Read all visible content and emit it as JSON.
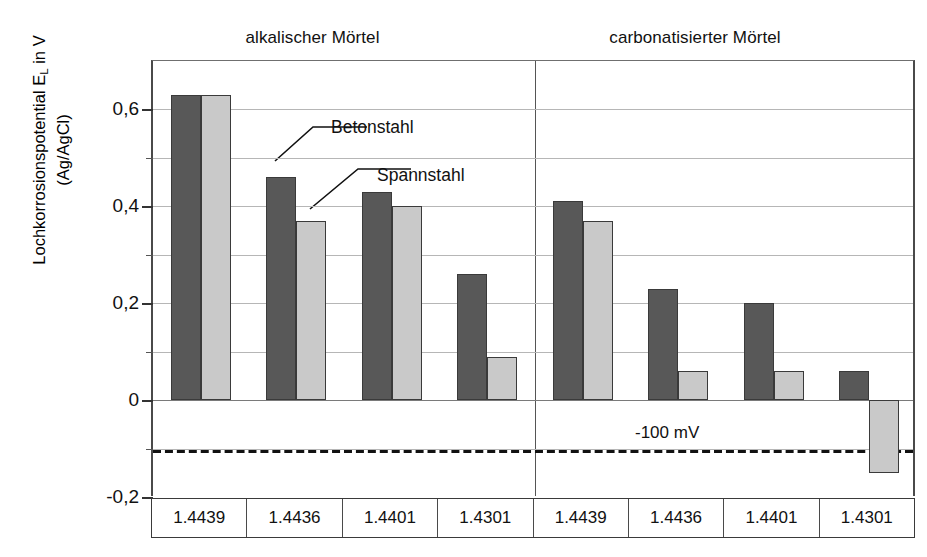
{
  "titles": {
    "left_group": "alkalischer Mörtel",
    "right_group": "carbonatisierter Mörtel"
  },
  "axis": {
    "ylabel_line1": "Lochkorrosionspotential E",
    "ylabel_line1_sub": "L",
    "ylabel_line1_tail": " in V",
    "ylabel_line2": "(Ag/AgCl)",
    "ticks": [
      "0,6",
      "0,4",
      "0,2",
      "0",
      "-0,2"
    ]
  },
  "annotations": {
    "series_dark": "Betonstahl",
    "series_light": "Spannstahl",
    "refline": "-100 mV"
  },
  "colors": {
    "dark_bar": "#585858",
    "light_bar": "#c9c9c9",
    "bar_outline": "#3a3a3a",
    "gridline": "#b6b6b6",
    "axis": "#4a4a4a"
  },
  "categories": [
    "1.4439",
    "1.4436",
    "1.4401",
    "1.4301",
    "1.4439",
    "1.4436",
    "1.4401",
    "1.4301"
  ],
  "chart_data": {
    "type": "bar",
    "title": "",
    "xlabel": "",
    "ylabel": "Lochkorrosionspotential E_L in V (Ag/AgCl)",
    "ylim": [
      -0.2,
      0.7
    ],
    "yticks": [
      -0.2,
      0,
      0.2,
      0.4,
      0.6
    ],
    "minor_gridlines": [
      -0.1,
      0.1,
      0.3,
      0.5
    ],
    "grid": true,
    "legend_position": "inline-callout",
    "group_labels": [
      "alkalischer Mörtel",
      "carbonatisierter Mörtel"
    ],
    "categories": [
      "1.4439",
      "1.4436",
      "1.4401",
      "1.4301",
      "1.4439",
      "1.4436",
      "1.4401",
      "1.4301"
    ],
    "series": [
      {
        "name": "Betonstahl",
        "color": "#585858",
        "values": [
          0.63,
          0.46,
          0.43,
          0.26,
          0.41,
          0.23,
          0.2,
          0.06
        ]
      },
      {
        "name": "Spannstahl",
        "color": "#c9c9c9",
        "values": [
          0.63,
          0.37,
          0.4,
          0.09,
          0.37,
          0.06,
          0.06,
          -0.15
        ]
      }
    ],
    "reference_lines": [
      {
        "value": -0.1,
        "label": "-100 mV",
        "style": "dashed"
      }
    ]
  }
}
